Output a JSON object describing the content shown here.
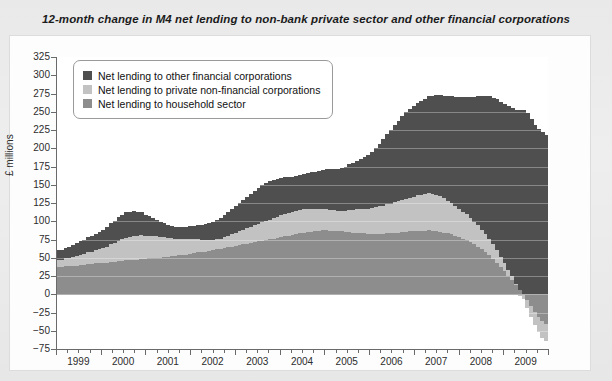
{
  "title": "12-month change in M4 net lending to non-bank private sector and other financial corporations",
  "legend": {
    "items": [
      {
        "label": "Net lending to other financial corporations",
        "color": "#4f4f4f"
      },
      {
        "label": "Net lending to private non-financial corporations",
        "color": "#c2c2c2"
      },
      {
        "label": "Net lending to household sector",
        "color": "#8d8d8d"
      }
    ]
  },
  "chart_data": {
    "type": "area",
    "stacked": true,
    "title": "12-month change in M4 net lending to non-bank private sector and other financial corporations",
    "xlabel": "",
    "ylabel": "£ millions",
    "ylim": [
      -75,
      325
    ],
    "ytick_step": 25,
    "yticks": [
      325,
      300,
      275,
      250,
      225,
      200,
      175,
      150,
      125,
      100,
      75,
      50,
      25,
      0,
      -25,
      -50,
      -75
    ],
    "xlim": [
      1999,
      2010
    ],
    "xticks": [
      1999,
      2000,
      2001,
      2002,
      2003,
      2004,
      2005,
      2006,
      2007,
      2008,
      2009
    ],
    "x_minor_interval": 0.25,
    "grid": "horizontal-faint",
    "legend_position": "top-left-inside",
    "colors": {
      "other_financial": "#4f4f4f",
      "private_non_financial": "#c2c2c2",
      "household": "#8d8d8d",
      "axis": "#6a6a6a",
      "plot_background": "#ffffff",
      "card_background": "#fdfdfd",
      "page_background": "#ececed"
    },
    "x": [
      1999.0,
      1999.08,
      1999.17,
      1999.25,
      1999.33,
      1999.42,
      1999.5,
      1999.58,
      1999.67,
      1999.75,
      1999.83,
      1999.92,
      2000.0,
      2000.08,
      2000.17,
      2000.25,
      2000.33,
      2000.42,
      2000.5,
      2000.58,
      2000.67,
      2000.75,
      2000.83,
      2000.92,
      2001.0,
      2001.08,
      2001.17,
      2001.25,
      2001.33,
      2001.42,
      2001.5,
      2001.58,
      2001.67,
      2001.75,
      2001.83,
      2001.92,
      2002.0,
      2002.08,
      2002.17,
      2002.25,
      2002.33,
      2002.42,
      2002.5,
      2002.58,
      2002.67,
      2002.75,
      2002.83,
      2002.92,
      2003.0,
      2003.08,
      2003.17,
      2003.25,
      2003.33,
      2003.42,
      2003.5,
      2003.58,
      2003.67,
      2003.75,
      2003.83,
      2003.92,
      2004.0,
      2004.08,
      2004.17,
      2004.25,
      2004.33,
      2004.42,
      2004.5,
      2004.58,
      2004.67,
      2004.75,
      2004.83,
      2004.92,
      2005.0,
      2005.08,
      2005.17,
      2005.25,
      2005.33,
      2005.42,
      2005.5,
      2005.58,
      2005.67,
      2005.75,
      2005.83,
      2005.92,
      2006.0,
      2006.08,
      2006.17,
      2006.25,
      2006.33,
      2006.42,
      2006.5,
      2006.58,
      2006.67,
      2006.75,
      2006.83,
      2006.92,
      2007.0,
      2007.08,
      2007.17,
      2007.25,
      2007.33,
      2007.42,
      2007.5,
      2007.58,
      2007.67,
      2007.75,
      2007.83,
      2007.92,
      2008.0,
      2008.08,
      2008.17,
      2008.25,
      2008.33,
      2008.42,
      2008.5,
      2008.58,
      2008.67,
      2008.75,
      2008.83,
      2008.92,
      2009.0,
      2009.08,
      2009.17,
      2009.25,
      2009.33,
      2009.42,
      2009.5,
      2009.58,
      2009.67,
      2009.75
    ],
    "series": [
      {
        "name": "Net lending to household sector",
        "color": "#8d8d8d",
        "values": [
          38,
          38,
          39,
          39,
          40,
          40,
          41,
          41,
          42,
          42,
          43,
          43,
          44,
          44,
          45,
          45,
          46,
          46,
          47,
          47,
          48,
          48,
          49,
          49,
          50,
          50,
          51,
          51,
          52,
          52,
          53,
          53,
          54,
          55,
          55,
          56,
          57,
          58,
          58,
          59,
          60,
          61,
          62,
          63,
          64,
          65,
          66,
          67,
          68,
          69,
          70,
          71,
          72,
          73,
          74,
          75,
          76,
          77,
          78,
          79,
          80,
          81,
          82,
          83,
          84,
          85,
          86,
          86,
          87,
          87,
          88,
          88,
          88,
          88,
          87,
          87,
          86,
          86,
          85,
          85,
          84,
          84,
          83,
          83,
          83,
          83,
          83,
          84,
          84,
          85,
          85,
          86,
          86,
          87,
          87,
          88,
          88,
          88,
          88,
          87,
          87,
          86,
          85,
          84,
          83,
          81,
          79,
          77,
          75,
          72,
          69,
          66,
          62,
          58,
          54,
          49,
          44,
          38,
          32,
          26,
          20,
          13,
          6,
          0,
          -8,
          -16,
          -24,
          -31,
          -37,
          -41
        ]
      },
      {
        "name": "Net lending to private non-financial corporations",
        "color": "#c2c2c2",
        "values": [
          10,
          10,
          11,
          11,
          12,
          13,
          14,
          15,
          16,
          17,
          18,
          19,
          20,
          22,
          24,
          26,
          28,
          30,
          31,
          32,
          33,
          33,
          33,
          32,
          31,
          30,
          29,
          28,
          27,
          26,
          25,
          24,
          23,
          22,
          21,
          20,
          19,
          18,
          17,
          16,
          15,
          14,
          14,
          14,
          15,
          16,
          17,
          18,
          19,
          20,
          21,
          22,
          23,
          24,
          25,
          26,
          27,
          28,
          29,
          30,
          31,
          31,
          32,
          32,
          32,
          32,
          31,
          31,
          30,
          30,
          29,
          29,
          28,
          28,
          28,
          28,
          29,
          30,
          31,
          32,
          33,
          34,
          35,
          36,
          37,
          38,
          39,
          40,
          41,
          42,
          43,
          44,
          45,
          46,
          47,
          48,
          49,
          50,
          51,
          51,
          50,
          49,
          47,
          45,
          43,
          41,
          39,
          37,
          35,
          33,
          31,
          29,
          27,
          25,
          23,
          20,
          17,
          14,
          11,
          8,
          5,
          2,
          -2,
          -6,
          -10,
          -14,
          -17,
          -20,
          -22,
          -23
        ]
      },
      {
        "name": "Net lending to other financial corporations",
        "color": "#4f4f4f",
        "values": [
          12,
          13,
          14,
          15,
          16,
          17,
          18,
          19,
          20,
          21,
          22,
          23,
          24,
          26,
          28,
          30,
          32,
          33,
          34,
          34,
          33,
          32,
          30,
          28,
          26,
          24,
          22,
          20,
          18,
          17,
          16,
          15,
          15,
          15,
          16,
          17,
          18,
          19,
          20,
          21,
          22,
          24,
          26,
          28,
          30,
          32,
          34,
          36,
          38,
          40,
          42,
          44,
          46,
          48,
          50,
          51,
          52,
          52,
          51,
          50,
          49,
          48,
          47,
          47,
          47,
          48,
          49,
          50,
          51,
          52,
          53,
          54,
          55,
          56,
          57,
          58,
          60,
          62,
          64,
          66,
          68,
          70,
          73,
          76,
          80,
          85,
          90,
          95,
          100,
          105,
          110,
          114,
          118,
          121,
          124,
          126,
          128,
          130,
          132,
          134,
          136,
          138,
          140,
          142,
          145,
          148,
          152,
          156,
          160,
          165,
          170,
          176,
          182,
          188,
          194,
          200,
          206,
          212,
          218,
          224,
          230,
          238,
          246,
          252,
          248,
          240,
          232,
          226,
          222,
          218
        ]
      }
    ],
    "annotations": [
      {
        "text": "Peak total ≈ 320",
        "x": 2009.2
      },
      {
        "text": "Household and corporate lending turn negative in 2009",
        "x": 2009.5
      }
    ]
  }
}
